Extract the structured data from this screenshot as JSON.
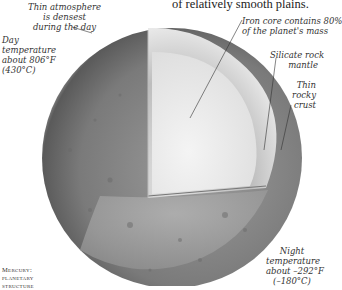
{
  "top_caption": "of relatively smooth plains.",
  "labels": {
    "atmosphere": [
      "Thin atmosphere",
      "is densest",
      "during the day"
    ],
    "day_temp": [
      "Day",
      "temperature",
      "about 806°F",
      "(430°C)"
    ],
    "core": [
      "Iron core contains 80%",
      "of the planet's mass"
    ],
    "mantle": [
      "Silicate rock",
      "mantle"
    ],
    "crust": [
      "Thin",
      "rocky",
      "crust"
    ],
    "night_temp": [
      "Night",
      "temperature",
      "about –292°F",
      "(–180°C)"
    ]
  },
  "figure_caption": [
    "Mercury:",
    "planetary",
    "structure"
  ],
  "colors": {
    "surface": "#8a8a8a",
    "mantle": "#c8c8c8",
    "core": "#ececec",
    "background": "#ffffff"
  }
}
